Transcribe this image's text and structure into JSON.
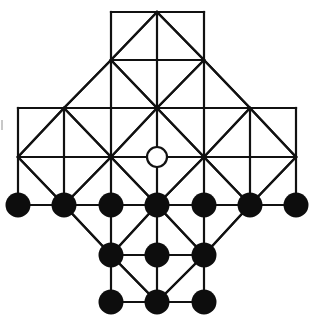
{
  "game": {
    "name": "Fox and Geese board",
    "colors": {
      "line": "#111111",
      "background": "#ffffff",
      "goose": "#0d0d0d",
      "fox_fill": "#ffffff",
      "fox_stroke": "#111111"
    },
    "grid": {
      "cols_x": [
        18,
        64,
        111,
        157,
        204,
        250,
        296
      ],
      "rows_y": [
        12,
        60,
        108,
        157,
        205,
        255,
        302
      ]
    },
    "pieces": {
      "fox": [
        {
          "col": 3,
          "row": 3
        }
      ],
      "geese": [
        {
          "col": 0,
          "row": 4
        },
        {
          "col": 1,
          "row": 4
        },
        {
          "col": 2,
          "row": 4
        },
        {
          "col": 3,
          "row": 4
        },
        {
          "col": 4,
          "row": 4
        },
        {
          "col": 5,
          "row": 4
        },
        {
          "col": 6,
          "row": 4
        },
        {
          "col": 2,
          "row": 5
        },
        {
          "col": 3,
          "row": 5
        },
        {
          "col": 4,
          "row": 5
        },
        {
          "col": 2,
          "row": 6
        },
        {
          "col": 3,
          "row": 6
        },
        {
          "col": 4,
          "row": 6
        }
      ]
    },
    "counts": {
      "fox": 1,
      "geese": 13
    }
  }
}
